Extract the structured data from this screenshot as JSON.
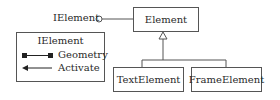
{
  "diagram": {
    "interface_label": "IElement",
    "classes": {
      "base": "Element",
      "children": [
        "TextElement",
        "FrameElement"
      ]
    },
    "legend": {
      "title": "IElement",
      "items": [
        {
          "label": "Geometry",
          "icon": "square-ended-line"
        },
        {
          "label": "Activate",
          "icon": "arrow-left"
        }
      ]
    },
    "colors": {
      "stroke": "#555555",
      "text": "#2a2a2a",
      "background": "#ffffff"
    }
  }
}
